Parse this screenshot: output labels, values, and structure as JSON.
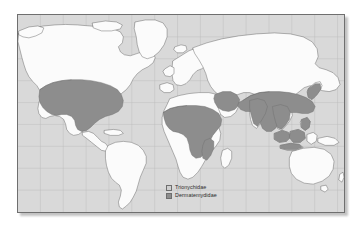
{
  "figure": {
    "kind": "world-distribution-map",
    "projection": "equirectangular",
    "ocean_color": "#d9d9d9",
    "land_color": "#fbfbfb",
    "coastline_color": "#555555",
    "border_color": "#6f6f6f",
    "graticule_color": "#b9b9b9",
    "page_background": "#ffffff"
  },
  "legend": {
    "entries": [
      {
        "label": "Trionychidae",
        "color": "#cfcfcf",
        "border": "#6e6e6e"
      },
      {
        "label": "Dermatemydidae",
        "color": "#8d8d8d",
        "border": "#6e6e6e"
      }
    ]
  },
  "graticule": {
    "meridian_count": 14,
    "parallel_count": 8,
    "visible": true
  },
  "distribution": {
    "shade_color": "#8d8d8d",
    "shade_outline": "#6a6a6a",
    "regions": [
      "North America (United States, southern Canada, northern Mexico)",
      "Sub-Saharan Africa (Sahel belt, West Africa, Congo, East Africa)",
      "Middle East (Levant, Mesopotamia, Arabian margins)",
      "South Asia (India, Pakistan, Bangladesh)",
      "East Asia (China, Korea, Japan)",
      "Southeast Asia (Indochina, Malay Peninsula, Sumatra, Borneo, Java)"
    ]
  }
}
